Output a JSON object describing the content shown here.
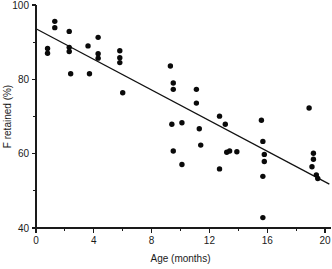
{
  "chart_data": {
    "type": "scatter",
    "title": "",
    "xlabel": "Age (months)",
    "ylabel": "F retained (%)",
    "xlim": [
      0,
      20
    ],
    "ylim": [
      40,
      100
    ],
    "xticks": [
      0,
      4,
      8,
      12,
      16,
      20
    ],
    "xtick_labels": [
      "0",
      "4",
      "8",
      "12",
      "16",
      "20"
    ],
    "xticks_minor": [
      2,
      6,
      10,
      14,
      18
    ],
    "yticks": [
      40,
      60,
      80,
      100
    ],
    "ytick_labels": [
      "40",
      "60",
      "80",
      "100"
    ],
    "yticks_minor": [
      50,
      70,
      90
    ],
    "grid": false,
    "legend": "none",
    "marker": "filled-circle",
    "marker_color": "#0a0a0a",
    "marker_size_px": 5.4,
    "series": [
      {
        "name": "Fluoride retained vs age",
        "points": [
          [
            0.8,
            88.3
          ],
          [
            0.8,
            87.0
          ],
          [
            1.3,
            95.6
          ],
          [
            1.3,
            93.9
          ],
          [
            2.3,
            92.9
          ],
          [
            2.3,
            88.6
          ],
          [
            2.3,
            87.5
          ],
          [
            2.4,
            81.5
          ],
          [
            3.6,
            89.0
          ],
          [
            3.7,
            81.5
          ],
          [
            4.3,
            91.3
          ],
          [
            4.3,
            86.9
          ],
          [
            4.3,
            85.7
          ],
          [
            5.8,
            87.7
          ],
          [
            5.8,
            85.8
          ],
          [
            5.8,
            84.5
          ],
          [
            6.0,
            76.4
          ],
          [
            9.3,
            83.6
          ],
          [
            9.5,
            79.0
          ],
          [
            9.5,
            77.3
          ],
          [
            9.4,
            67.9
          ],
          [
            9.5,
            60.7
          ],
          [
            10.1,
            68.3
          ],
          [
            10.1,
            57.1
          ],
          [
            11.1,
            77.3
          ],
          [
            11.1,
            73.6
          ],
          [
            11.3,
            66.7
          ],
          [
            11.4,
            62.3
          ],
          [
            12.7,
            70.1
          ],
          [
            12.7,
            55.9
          ],
          [
            13.1,
            67.9
          ],
          [
            13.2,
            60.4
          ],
          [
            13.4,
            60.7
          ],
          [
            13.9,
            60.5
          ],
          [
            15.6,
            69.0
          ],
          [
            15.7,
            63.3
          ],
          [
            15.8,
            59.8
          ],
          [
            15.8,
            57.9
          ],
          [
            15.7,
            53.9
          ],
          [
            15.7,
            42.8
          ],
          [
            18.9,
            72.3
          ],
          [
            19.2,
            60.1
          ],
          [
            19.2,
            58.5
          ],
          [
            19.1,
            56.5
          ],
          [
            19.4,
            54.3
          ],
          [
            19.5,
            53.3
          ]
        ]
      }
    ],
    "trendline": {
      "name": "linear regression fit",
      "x_start": 0,
      "y_start": 93.6,
      "x_end": 20.3,
      "y_end": 51.8
    }
  }
}
